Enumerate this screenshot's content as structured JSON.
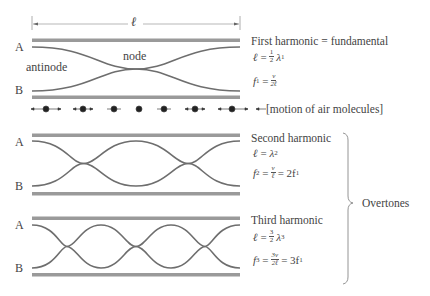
{
  "length_label": "ℓ",
  "sections": [
    {
      "title": "First harmonic = fundamental",
      "label_a": "A",
      "label_b": "B",
      "antinode_label": "antinode",
      "node_label": "node",
      "eq1": {
        "lhs": "ℓ",
        "eq": "=",
        "num": "1",
        "den": "2",
        "rhs": "λ",
        "sub": "1"
      },
      "eq2": {
        "lhs": "f",
        "lhs_sub": "1",
        "eq": "=",
        "num": "v",
        "den": "2ℓ",
        "tail": ""
      }
    },
    {
      "title": "Second harmonic",
      "label_a": "A",
      "label_b": "B",
      "eq1": {
        "lhs": "ℓ",
        "eq": "=",
        "rhs": "λ",
        "sub": "2"
      },
      "eq2": {
        "lhs": "f",
        "lhs_sub": "2",
        "eq": "=",
        "num": "v",
        "den": "ℓ",
        "tail": "= 2f",
        "tail_sub": "1"
      }
    },
    {
      "title": "Third harmonic",
      "label_a": "A",
      "label_b": "B",
      "eq1": {
        "lhs": "ℓ",
        "eq": "=",
        "num": "3",
        "den": "2",
        "rhs": "λ",
        "sub": "3"
      },
      "eq2": {
        "lhs": "f",
        "lhs_sub": "3",
        "eq": "=",
        "num": "3v",
        "den": "2ℓ",
        "tail": "= 3f",
        "tail_sub": "1"
      }
    }
  ],
  "molecules_label": "[motion of air molecules]",
  "overtones_label": "Overtones",
  "colors": {
    "tube_wall": "#9a9a9a",
    "wave": "#6e6e6e",
    "text": "#444444"
  }
}
